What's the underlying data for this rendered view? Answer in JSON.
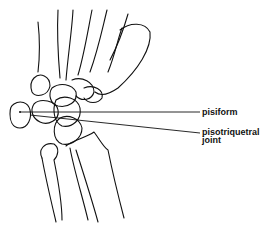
{
  "figure": {
    "labels": {
      "pisiform": "pisiform",
      "pisotriquetral_joint_line1": "pisotriquetral",
      "pisotriquetral_joint_line2": "joint"
    },
    "stroke_color": "#111111",
    "background_color": "#ffffff"
  }
}
